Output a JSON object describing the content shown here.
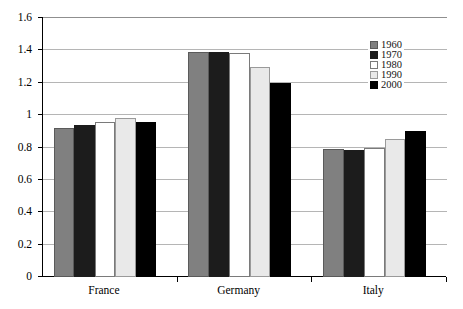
{
  "chart_data": {
    "type": "bar",
    "title": "",
    "subtitle": "",
    "xlabel": "",
    "ylabel": "",
    "categories": [
      "France",
      "Germany",
      "Italy"
    ],
    "series": [
      {
        "name": "1960",
        "color": "#808080",
        "values": [
          0.92,
          1.39,
          0.79
        ]
      },
      {
        "name": "1970",
        "color": "#1c1c1c",
        "values": [
          0.94,
          1.39,
          0.785
        ]
      },
      {
        "name": "1980",
        "color": "#ffffff",
        "values": [
          0.96,
          1.385,
          0.8
        ]
      },
      {
        "name": "1990",
        "color": "#e9e9e9",
        "values": [
          0.98,
          1.3,
          0.855
        ]
      },
      {
        "name": "2000",
        "color": "#000000",
        "values": [
          0.955,
          1.2,
          0.9
        ]
      }
    ],
    "ylim": [
      0,
      1.6
    ],
    "ytick_labels": [
      "0",
      "0.2",
      "0.4",
      "0.6",
      "0.8",
      "1",
      "1.2",
      "1.4",
      "1.6"
    ],
    "ytick_values": [
      0,
      0.2,
      0.4,
      0.6,
      0.8,
      1.0,
      1.2,
      1.4,
      1.6
    ],
    "grid": true,
    "grid_axis": "y",
    "legend_position": "top-right",
    "legend_entries": [
      "1960",
      "1970",
      "1980",
      "1990",
      "2000"
    ],
    "annotations": []
  },
  "style": {
    "background": "#ffffff",
    "axis_color": "#000000",
    "grid_color": "#b5b5b5",
    "text_color": "#000000"
  }
}
